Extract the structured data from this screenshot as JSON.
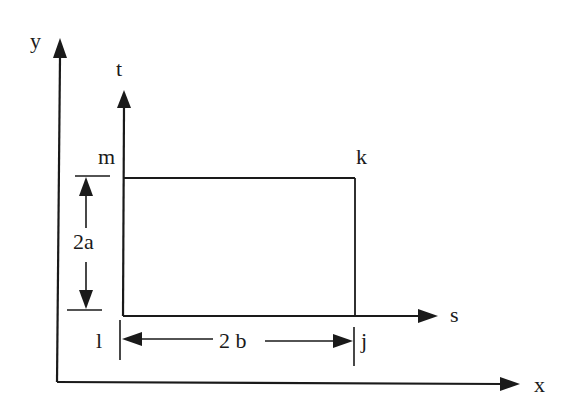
{
  "diagram": {
    "type": "rectangular element with local and global coordinate systems",
    "global_axes": {
      "x_label": "x",
      "y_label": "y"
    },
    "local_axes": {
      "s_label": "s",
      "t_label": "t"
    },
    "nodes": {
      "bottom_left": "l",
      "bottom_right": "j",
      "top_right": "k",
      "top_left": "m"
    },
    "dimensions": {
      "height_label": "2a",
      "width_label": "2 b"
    },
    "colors": {
      "ink": "#1a1a1a",
      "background": "#ffffff"
    }
  }
}
